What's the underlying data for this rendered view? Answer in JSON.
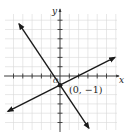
{
  "chart_data": {
    "type": "line",
    "title": "",
    "xlabel": "x",
    "ylabel": "y",
    "origin_label": "O",
    "xlim": [
      -6,
      6
    ],
    "ylim": [
      -6,
      7
    ],
    "grid": true,
    "legend": null,
    "series": [
      {
        "name": "line-1",
        "equation": "y = -1.5x - 1",
        "slope": -1.5,
        "intercept": -1,
        "x": [
          -4.4,
          3.1
        ],
        "y": [
          5.6,
          -5.6
        ]
      },
      {
        "name": "line-2",
        "equation": "y = 0.5x - 1",
        "slope": 0.5,
        "intercept": -1,
        "x": [
          -5.6,
          5.9
        ],
        "y": [
          -3.8,
          2.0
        ]
      }
    ],
    "annotations": [
      {
        "text": "(0, −1)",
        "x": 0,
        "y": -1,
        "marker": "point"
      }
    ]
  },
  "colors": {
    "grid": "#d9d9d9",
    "axis": "#333333",
    "line": "#1a1a1a"
  }
}
